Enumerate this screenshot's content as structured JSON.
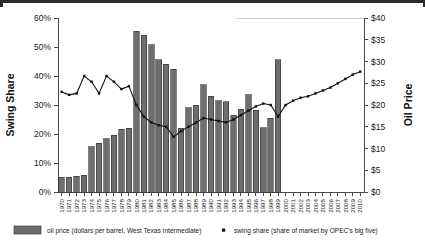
{
  "figure": {
    "bar_color": "#6e6e6e",
    "bar_edge_color": "#2f2f2f",
    "line_color": "#111111",
    "axis_color": "#4a4a4a",
    "background": "#ffffff"
  },
  "legend": {
    "bars_label": "oil price (dollars per barrel, West Texas Intermediate)",
    "line_label": "swing share (share of market by OPEC's big five)",
    "bars_swatch_name": "bar-swatch",
    "line_marker_name": "line-marker-swatch"
  },
  "chart_data": {
    "type": "bar",
    "title": "",
    "xlabel": "",
    "ylabel": "Swing Share",
    "y2label": "Oil Price",
    "ylim": [
      0,
      60
    ],
    "y2lim": [
      0,
      40
    ],
    "grid": false,
    "legend_position": "bottom",
    "ytick_labels": [
      "0%",
      "10%",
      "20%",
      "30%",
      "40%",
      "50%",
      "60%"
    ],
    "ytick_values": [
      0,
      10,
      20,
      30,
      40,
      50,
      60
    ],
    "y2tick_labels": [
      "$0",
      "$5",
      "$10",
      "$15",
      "$20",
      "$25",
      "$30",
      "$35",
      "$40"
    ],
    "y2tick_values": [
      0,
      5,
      10,
      15,
      20,
      25,
      30,
      35,
      40
    ],
    "categories": [
      "1970",
      "1971",
      "1972",
      "1973",
      "1974",
      "1975",
      "1976",
      "1977",
      "1978",
      "1979",
      "1980",
      "1981",
      "1982",
      "1983",
      "1984",
      "1985",
      "1986",
      "1987",
      "1988",
      "1989",
      "1990",
      "1991",
      "1992",
      "1993",
      "1994",
      "1995",
      "1996",
      "1997",
      "1998",
      "1999",
      "2000",
      "2001",
      "2002",
      "2003",
      "2004",
      "2005",
      "2006",
      "2007",
      "2008",
      "2009",
      "2010"
    ],
    "xtick_labels": [
      "1970",
      "1971",
      "1972",
      "1973",
      "1974",
      "1975",
      "1976",
      "1977",
      "1978",
      "1979",
      "1980",
      "1981",
      "1982",
      "1983",
      "1984",
      "1985",
      "1986",
      "1987",
      "1988",
      "1989",
      "1990",
      "1991",
      "1992",
      "1993",
      "1994",
      "1995",
      "1996",
      "1997",
      "1998",
      "1999",
      "2000",
      "2001",
      "2002",
      "2003",
      "2004",
      "2005",
      "2006",
      "2007",
      "2008",
      "2009",
      "2010"
    ],
    "series": [
      {
        "name": "oil price (dollars per barrel, West Texas Intermediate)",
        "type": "bar",
        "axis": "right",
        "unit": "USD per barrel",
        "values": [
          3.4,
          3.4,
          3.6,
          3.8,
          10.4,
          11.2,
          12.2,
          13.0,
          14.4,
          14.6,
          37.0,
          36.0,
          33.8,
          30.4,
          29.4,
          28.2,
          14.6,
          19.4,
          20.0,
          24.6,
          22.0,
          21.0,
          20.8,
          17.6,
          19.0,
          22.4,
          18.8,
          14.8,
          17.0,
          30.4,
          null,
          null,
          null,
          null,
          null,
          null,
          null,
          null,
          null,
          null,
          null
        ]
      },
      {
        "name": "swing share (share of market by OPEC's big five)",
        "type": "line",
        "axis": "left",
        "unit": "percent",
        "values": [
          34.5,
          33.5,
          34.0,
          40.0,
          38.0,
          34.0,
          40.0,
          38.0,
          35.5,
          36.5,
          30.0,
          26.0,
          24.0,
          23.0,
          22.5,
          19.0,
          21.0,
          22.5,
          24.0,
          25.5,
          25.0,
          24.5,
          24.0,
          25.0,
          26.5,
          28.0,
          29.5,
          30.5,
          30.0,
          26.0,
          30.0,
          31.5,
          32.5,
          33.0,
          34.0,
          35.0,
          36.0,
          37.5,
          39.0,
          40.5,
          41.5
        ]
      }
    ]
  }
}
